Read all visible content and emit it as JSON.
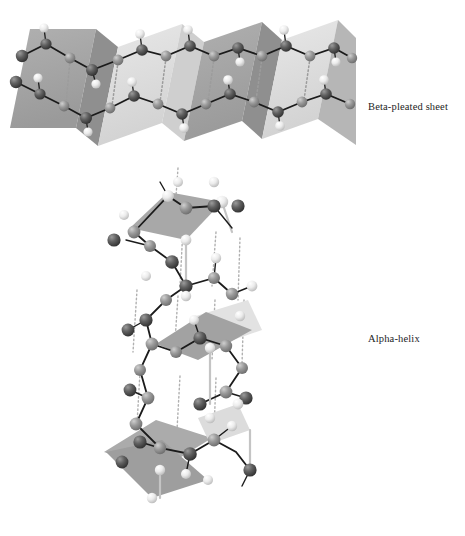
{
  "figure": {
    "background_color": "#ffffff",
    "width": 465,
    "height": 536,
    "labels": {
      "beta_sheet": "Beta-pleated sheet",
      "alpha_helix": "Alpha-helix"
    },
    "palette": {
      "plane_dark": "#a4a4a4",
      "plane_mid": "#bdbdbd",
      "plane_light": "#dedede",
      "plane_pale": "#efefef",
      "atom_dark": "#4a4a4a",
      "atom_mid": "#8e8e8e",
      "atom_light": "#f2f2f2",
      "bond": "#1b1b1b",
      "bond_light": "#c9c9c9",
      "hbond": "#b5b5b5",
      "label_color": "#1d1d1d"
    },
    "structures": [
      {
        "name": "beta-pleated-sheet",
        "label": "Beta-pleated sheet",
        "description": "Accordion-pleated sheet of alternating light and dark facets with two antiparallel polypeptide backbones joined by hydrogen bonds",
        "chains": 2,
        "pleats": 4
      },
      {
        "name": "alpha-helix",
        "label": "Alpha-helix",
        "description": "Right-handed spiral of planar peptide units connected by a zig-zag backbone with vertical dotted hydrogen bonds",
        "peptide_planes": 5
      }
    ]
  }
}
